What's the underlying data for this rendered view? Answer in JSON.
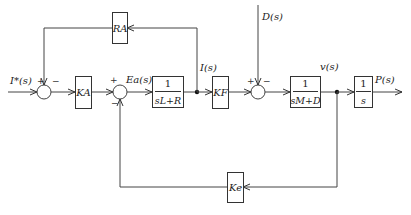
{
  "diagram": {
    "type": "control-block-diagram",
    "input_label": "I*(s)",
    "signals": {
      "error_voltage": "Ea(s)",
      "current": "I(s)",
      "disturbance": "D(s)",
      "velocity": "v(s)",
      "output": "P(s)"
    },
    "blocks": {
      "ra": {
        "label": "RA"
      },
      "ka": {
        "label": "KA"
      },
      "electrical": {
        "numerator": "1",
        "denominator": "sL+R"
      },
      "kf": {
        "label": "KF"
      },
      "mechanical": {
        "numerator": "1",
        "denominator": "sM+D"
      },
      "integrator": {
        "numerator": "1",
        "denominator": "s"
      },
      "ke": {
        "label": "Ke"
      }
    },
    "summing_junctions": {
      "sum1": {
        "plus": "+",
        "minus": "−"
      },
      "sum2": {
        "plus": "+",
        "minus": "−"
      },
      "sum3": {
        "plus": "+",
        "minus": "−"
      }
    },
    "colors": {
      "line": "#333333",
      "background": "#ffffff"
    }
  }
}
